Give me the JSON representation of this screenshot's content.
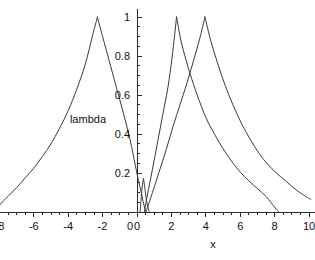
{
  "chart_data": {
    "type": "line",
    "title": "",
    "xlabel": "x",
    "ylabel": "lambda",
    "xlim": [
      -8.8,
      10.4
    ],
    "ylim": [
      0,
      1.04
    ],
    "grid": false,
    "legend": "none",
    "x_ticks": [
      -8,
      -6,
      -4,
      -2,
      0,
      2,
      4,
      6,
      8,
      10
    ],
    "x_tick_labels": [
      "-8",
      "-6",
      "-4",
      "-2",
      "0",
      "2",
      "4",
      "6",
      "8",
      "10"
    ],
    "x_minor_tick_step": 0.5,
    "y_ticks": [
      0,
      0.2,
      0.4,
      0.6,
      0.8,
      1
    ],
    "y_tick_labels": [
      "0",
      "0.2",
      "0.4",
      "0.6",
      "0.8",
      "1"
    ],
    "y_minor_tick_step": 0.05,
    "series": [
      {
        "name": "curve-left",
        "peak_x": -2.3,
        "peak_y": 1,
        "points": [
          [
            -8.25,
            0.0
          ],
          [
            -8.0,
            0.035
          ],
          [
            -7.5,
            0.08
          ],
          [
            -7.0,
            0.125
          ],
          [
            -6.5,
            0.175
          ],
          [
            -6.0,
            0.225
          ],
          [
            -5.5,
            0.285
          ],
          [
            -5.0,
            0.35
          ],
          [
            -4.5,
            0.43
          ],
          [
            -4.0,
            0.52
          ],
          [
            -3.5,
            0.63
          ],
          [
            -3.0,
            0.76
          ],
          [
            -2.6,
            0.9
          ],
          [
            -2.3,
            1.0
          ],
          [
            -2.0,
            0.9
          ],
          [
            -1.6,
            0.77
          ],
          [
            -1.2,
            0.64
          ],
          [
            -0.8,
            0.51
          ],
          [
            -0.4,
            0.37
          ],
          [
            -0.1,
            0.24
          ],
          [
            0.1,
            0.155
          ],
          [
            0.25,
            0.1
          ],
          [
            0.35,
            0.055
          ],
          [
            0.45,
            0.02
          ],
          [
            0.5,
            0.0
          ]
        ]
      },
      {
        "name": "curve-narrow-spike",
        "peak_x": 0.38,
        "peak_y": 0.17,
        "points": [
          [
            0.18,
            0.0
          ],
          [
            0.25,
            0.08
          ],
          [
            0.32,
            0.14
          ],
          [
            0.38,
            0.17
          ],
          [
            0.46,
            0.12
          ],
          [
            0.55,
            0.06
          ],
          [
            0.65,
            0.02
          ],
          [
            0.72,
            0.0
          ]
        ]
      },
      {
        "name": "curve-middle",
        "peak_x": 2.3,
        "peak_y": 1,
        "points": [
          [
            0.42,
            0.0
          ],
          [
            0.6,
            0.085
          ],
          [
            0.9,
            0.22
          ],
          [
            1.2,
            0.36
          ],
          [
            1.5,
            0.5
          ],
          [
            1.8,
            0.64
          ],
          [
            2.05,
            0.8
          ],
          [
            2.3,
            1.0
          ],
          [
            2.55,
            0.88
          ],
          [
            2.85,
            0.78
          ],
          [
            3.1,
            0.705
          ],
          [
            3.5,
            0.6
          ],
          [
            4.0,
            0.485
          ],
          [
            4.5,
            0.4
          ],
          [
            5.0,
            0.325
          ],
          [
            5.5,
            0.26
          ],
          [
            6.0,
            0.205
          ],
          [
            6.5,
            0.16
          ],
          [
            7.0,
            0.12
          ],
          [
            7.5,
            0.08
          ],
          [
            8.0,
            0.025
          ],
          [
            8.25,
            0.0
          ]
        ]
      },
      {
        "name": "curve-right",
        "peak_x": 3.95,
        "peak_y": 1,
        "points": [
          [
            0.52,
            0.0
          ],
          [
            0.9,
            0.1
          ],
          [
            1.3,
            0.21
          ],
          [
            1.7,
            0.32
          ],
          [
            2.1,
            0.44
          ],
          [
            2.5,
            0.55
          ],
          [
            2.9,
            0.66
          ],
          [
            3.3,
            0.78
          ],
          [
            3.65,
            0.89
          ],
          [
            3.95,
            1.0
          ],
          [
            4.3,
            0.875
          ],
          [
            4.7,
            0.76
          ],
          [
            5.1,
            0.655
          ],
          [
            5.6,
            0.545
          ],
          [
            6.1,
            0.45
          ],
          [
            6.6,
            0.37
          ],
          [
            7.1,
            0.3
          ],
          [
            7.6,
            0.245
          ],
          [
            8.1,
            0.2
          ],
          [
            8.7,
            0.155
          ],
          [
            9.3,
            0.11
          ],
          [
            9.9,
            0.075
          ],
          [
            10.1,
            0.065
          ]
        ]
      }
    ],
    "annotations": [
      {
        "name": "curve-crossing",
        "x": 3.1,
        "y": 0.71
      }
    ]
  }
}
